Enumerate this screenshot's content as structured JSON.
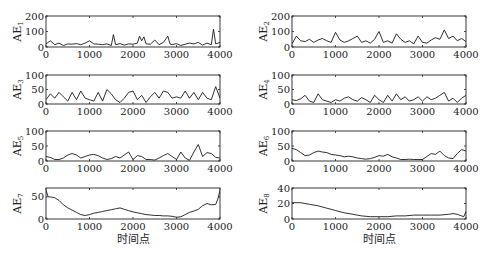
{
  "chart_data": [
    {
      "type": "line",
      "panel": 1,
      "ylabel": "AE",
      "ylabel_sub": "1",
      "xlim": [
        0,
        4000
      ],
      "ylim": [
        0,
        200
      ],
      "xticks": [
        0,
        1000,
        2000,
        3000,
        4000
      ],
      "yticks": [
        0,
        100,
        200
      ],
      "xlabel": "",
      "x": [
        0,
        100,
        200,
        300,
        400,
        500,
        600,
        700,
        800,
        900,
        1000,
        1100,
        1200,
        1300,
        1400,
        1500,
        1550,
        1600,
        1700,
        1800,
        1900,
        2000,
        2100,
        2150,
        2200,
        2250,
        2300,
        2400,
        2500,
        2600,
        2700,
        2800,
        2850,
        2900,
        3000,
        3100,
        3200,
        3300,
        3400,
        3500,
        3600,
        3700,
        3800,
        3850,
        3900,
        4000
      ],
      "values": [
        20,
        40,
        15,
        25,
        10,
        20,
        18,
        22,
        15,
        25,
        40,
        20,
        18,
        15,
        20,
        10,
        80,
        15,
        22,
        12,
        20,
        18,
        25,
        70,
        40,
        65,
        20,
        18,
        45,
        15,
        30,
        70,
        20,
        15,
        22,
        10,
        18,
        25,
        20,
        30,
        12,
        25,
        15,
        115,
        20,
        30
      ]
    },
    {
      "type": "line",
      "panel": 2,
      "ylabel": "AE",
      "ylabel_sub": "2",
      "xlim": [
        0,
        4000
      ],
      "ylim": [
        0,
        200
      ],
      "xticks": [
        0,
        1000,
        2000,
        3000,
        4000
      ],
      "yticks": [
        0,
        100,
        200
      ],
      "xlabel": "",
      "x": [
        0,
        100,
        200,
        300,
        400,
        500,
        600,
        700,
        800,
        900,
        1000,
        1100,
        1200,
        1300,
        1400,
        1500,
        1600,
        1700,
        1800,
        1900,
        2000,
        2100,
        2200,
        2300,
        2400,
        2500,
        2600,
        2700,
        2800,
        2900,
        3000,
        3100,
        3200,
        3300,
        3400,
        3500,
        3600,
        3700,
        3800,
        3900,
        4000
      ],
      "values": [
        20,
        70,
        40,
        35,
        50,
        30,
        45,
        55,
        40,
        30,
        95,
        45,
        30,
        40,
        55,
        70,
        30,
        40,
        25,
        50,
        100,
        30,
        40,
        25,
        85,
        50,
        30,
        40,
        20,
        70,
        30,
        25,
        45,
        60,
        50,
        110,
        55,
        70,
        40,
        55,
        35
      ]
    },
    {
      "type": "line",
      "panel": 3,
      "ylabel": "AE",
      "ylabel_sub": "3",
      "xlim": [
        0,
        4000
      ],
      "ylim": [
        0,
        100
      ],
      "xticks": [
        0,
        1000,
        2000,
        3000,
        4000
      ],
      "yticks": [
        0,
        50,
        100
      ],
      "xlabel": "",
      "x": [
        0,
        100,
        200,
        300,
        400,
        500,
        600,
        700,
        800,
        900,
        1000,
        1100,
        1200,
        1300,
        1400,
        1500,
        1600,
        1700,
        1800,
        1900,
        2000,
        2100,
        2200,
        2300,
        2400,
        2500,
        2600,
        2700,
        2800,
        2900,
        3000,
        3100,
        3200,
        3300,
        3400,
        3500,
        3600,
        3700,
        3800,
        3900,
        4000
      ],
      "values": [
        15,
        35,
        20,
        40,
        25,
        10,
        40,
        15,
        45,
        20,
        15,
        10,
        40,
        10,
        50,
        35,
        15,
        5,
        20,
        40,
        45,
        15,
        30,
        5,
        25,
        40,
        20,
        45,
        40,
        20,
        25,
        20,
        45,
        20,
        40,
        15,
        40,
        20,
        15,
        60,
        20
      ]
    },
    {
      "type": "line",
      "panel": 4,
      "ylabel": "AE",
      "ylabel_sub": "4",
      "xlim": [
        0,
        4000
      ],
      "ylim": [
        0,
        100
      ],
      "xticks": [
        0,
        1000,
        2000,
        3000,
        4000
      ],
      "yticks": [
        0,
        50,
        100
      ],
      "xlabel": "",
      "x": [
        0,
        100,
        200,
        300,
        400,
        500,
        600,
        700,
        800,
        900,
        1000,
        1100,
        1200,
        1300,
        1400,
        1500,
        1600,
        1700,
        1800,
        1900,
        2000,
        2100,
        2200,
        2300,
        2400,
        2500,
        2600,
        2700,
        2800,
        2900,
        3000,
        3100,
        3200,
        3300,
        3400,
        3500,
        3600,
        3700,
        3800,
        3900,
        4000
      ],
      "values": [
        15,
        12,
        18,
        30,
        10,
        5,
        35,
        15,
        10,
        5,
        15,
        10,
        20,
        25,
        15,
        10,
        22,
        15,
        5,
        30,
        15,
        5,
        30,
        10,
        35,
        15,
        25,
        10,
        15,
        25,
        10,
        25,
        15,
        20,
        30,
        40,
        10,
        20,
        5,
        20,
        30
      ]
    },
    {
      "type": "line",
      "panel": 5,
      "ylabel": "AE",
      "ylabel_sub": "5",
      "xlim": [
        0,
        4000
      ],
      "ylim": [
        0,
        100
      ],
      "xticks": [
        0,
        1000,
        2000,
        3000,
        4000
      ],
      "yticks": [
        0,
        50,
        100
      ],
      "xlabel": "",
      "x": [
        0,
        100,
        200,
        300,
        400,
        500,
        600,
        700,
        800,
        900,
        1000,
        1100,
        1200,
        1300,
        1400,
        1500,
        1600,
        1700,
        1800,
        1900,
        2000,
        2100,
        2200,
        2300,
        2400,
        2500,
        2600,
        2700,
        2800,
        2900,
        3000,
        3100,
        3200,
        3300,
        3400,
        3500,
        3600,
        3700,
        3800,
        3900,
        4000
      ],
      "values": [
        15,
        12,
        5,
        5,
        10,
        20,
        25,
        20,
        10,
        15,
        20,
        22,
        18,
        10,
        5,
        8,
        15,
        10,
        20,
        30,
        5,
        18,
        15,
        5,
        5,
        3,
        10,
        18,
        25,
        15,
        5,
        30,
        10,
        2,
        30,
        55,
        15,
        28,
        25,
        12,
        10
      ]
    },
    {
      "type": "line",
      "panel": 6,
      "ylabel": "AE",
      "ylabel_sub": "6",
      "xlim": [
        0,
        4000
      ],
      "ylim": [
        0,
        100
      ],
      "xticks": [
        0,
        1000,
        2000,
        3000,
        4000
      ],
      "yticks": [
        0,
        50,
        100
      ],
      "xlabel": "",
      "x": [
        0,
        100,
        200,
        300,
        400,
        500,
        600,
        700,
        800,
        900,
        1000,
        1100,
        1200,
        1300,
        1400,
        1500,
        1600,
        1700,
        1800,
        1900,
        2000,
        2100,
        2200,
        2300,
        2400,
        2500,
        2600,
        2700,
        2800,
        2900,
        3000,
        3100,
        3200,
        3300,
        3400,
        3500,
        3600,
        3700,
        3800,
        3900,
        4000
      ],
      "values": [
        42,
        38,
        28,
        18,
        20,
        28,
        33,
        30,
        28,
        22,
        20,
        18,
        14,
        16,
        14,
        10,
        8,
        6,
        8,
        12,
        18,
        16,
        22,
        14,
        10,
        5,
        5,
        6,
        5,
        5,
        5,
        15,
        25,
        22,
        33,
        18,
        10,
        8,
        25,
        38,
        33
      ]
    },
    {
      "type": "line",
      "panel": 7,
      "ylabel": "AE",
      "ylabel_sub": "7",
      "xlim": [
        0,
        4000
      ],
      "ylim": [
        0,
        70
      ],
      "xticks": [
        0,
        1000,
        2000,
        3000,
        4000
      ],
      "yticks": [
        0,
        50
      ],
      "xlabel": "时间点",
      "x": [
        0,
        50,
        100,
        200,
        300,
        400,
        500,
        600,
        700,
        800,
        900,
        1000,
        1100,
        1200,
        1300,
        1400,
        1500,
        1600,
        1700,
        1800,
        1900,
        2000,
        2100,
        2200,
        2300,
        2400,
        2500,
        2600,
        2700,
        2800,
        2900,
        3000,
        3100,
        3200,
        3300,
        3400,
        3500,
        3600,
        3700,
        3800,
        3900,
        3950,
        4000
      ],
      "values": [
        65,
        50,
        50,
        48,
        42,
        32,
        25,
        20,
        15,
        10,
        8,
        10,
        13,
        15,
        17,
        19,
        21,
        23,
        25,
        22,
        19,
        16,
        14,
        12,
        10,
        9,
        8,
        8,
        7,
        7,
        6,
        4,
        5,
        10,
        15,
        18,
        22,
        30,
        35,
        32,
        33,
        45,
        65
      ]
    },
    {
      "type": "line",
      "panel": 8,
      "ylabel": "AE",
      "ylabel_sub": "8",
      "xlim": [
        0,
        4000
      ],
      "ylim": [
        0,
        40
      ],
      "xticks": [
        0,
        1000,
        2000,
        3000,
        4000
      ],
      "yticks": [
        0,
        20,
        40
      ],
      "xlabel": "时间点",
      "x": [
        0,
        200,
        400,
        600,
        800,
        1000,
        1200,
        1400,
        1600,
        1800,
        2000,
        2200,
        2400,
        2600,
        2800,
        3000,
        3200,
        3400,
        3600,
        3700,
        3800,
        3900,
        3950,
        4000
      ],
      "values": [
        21,
        21,
        19,
        17,
        14,
        11,
        8,
        6,
        4,
        3,
        3,
        3,
        4,
        4,
        5,
        5,
        5,
        5,
        6,
        7,
        6,
        4,
        3,
        10
      ]
    }
  ]
}
